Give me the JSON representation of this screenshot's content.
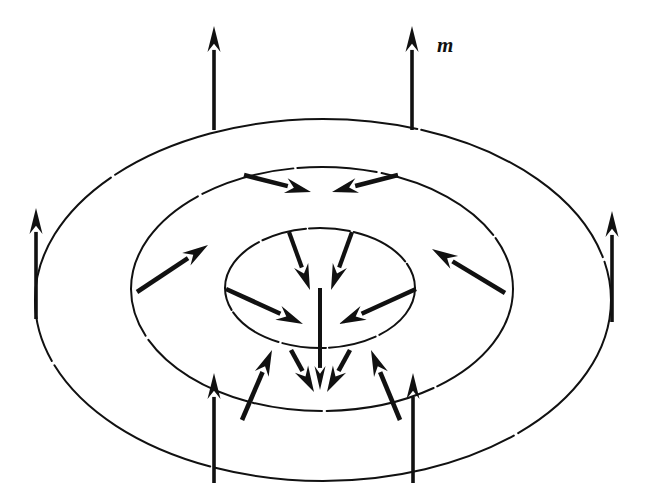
{
  "figure": {
    "domain_type": "diagram",
    "background_color": "#ffffff",
    "ink_color": "#111111",
    "width": 646,
    "height": 503,
    "labels": [
      {
        "id": "magnetization-label",
        "text": "m",
        "x": 437,
        "y": 52,
        "style": "bold-italic-serif",
        "font_size": 21
      }
    ],
    "rings": [
      {
        "id": "outer-ring",
        "name": "outer-ellipse",
        "cx": 323,
        "cy": 300,
        "rx": 288,
        "ry": 181,
        "stroke_width": 2.0,
        "dash": "hand-drawn"
      },
      {
        "id": "middle-ring",
        "name": "middle-ellipse",
        "cx": 322,
        "cy": 289,
        "rx": 191,
        "ry": 122,
        "stroke_width": 2.0,
        "dash": "hand-drawn"
      },
      {
        "id": "inner-ring",
        "name": "inner-ellipse",
        "cx": 320,
        "cy": 288,
        "rx": 95,
        "ry": 60,
        "stroke_width": 2.0,
        "dash": "hand-drawn"
      }
    ],
    "vectors": [
      {
        "id": "v-outer-top-left",
        "group": "outer-ring",
        "direction": "up",
        "x1": 214,
        "y1": 130,
        "x2": 214,
        "y2": 26,
        "stroke_width": 3.6,
        "head_len": 26,
        "head_w": 13
      },
      {
        "id": "v-outer-top-right",
        "group": "outer-ring",
        "direction": "up",
        "x1": 412,
        "y1": 130,
        "x2": 412,
        "y2": 26,
        "stroke_width": 3.6,
        "head_len": 26,
        "head_w": 13
      },
      {
        "id": "v-outer-left",
        "group": "outer-ring",
        "direction": "up",
        "x1": 36,
        "y1": 319,
        "x2": 36,
        "y2": 208,
        "stroke_width": 3.6,
        "head_len": 26,
        "head_w": 13
      },
      {
        "id": "v-outer-right",
        "group": "outer-ring",
        "direction": "up",
        "x1": 612,
        "y1": 322,
        "x2": 612,
        "y2": 211,
        "stroke_width": 3.6,
        "head_len": 26,
        "head_w": 13
      },
      {
        "id": "v-outer-bottom-left",
        "group": "outer-ring",
        "direction": "up",
        "x1": 214,
        "y1": 483,
        "x2": 214,
        "y2": 373,
        "stroke_width": 3.6,
        "head_len": 26,
        "head_w": 13
      },
      {
        "id": "v-outer-bottom-right",
        "group": "outer-ring",
        "direction": "up",
        "x1": 413,
        "y1": 483,
        "x2": 413,
        "y2": 373,
        "stroke_width": 3.6,
        "head_len": 26,
        "head_w": 13
      },
      {
        "id": "v-mid-top-left",
        "group": "middle-ring",
        "direction": "down-right",
        "x1": 244,
        "y1": 175,
        "x2": 311,
        "y2": 192,
        "stroke_width": 4.6,
        "head_len": 26,
        "head_w": 15
      },
      {
        "id": "v-mid-top-right",
        "group": "middle-ring",
        "direction": "down-left",
        "x1": 398,
        "y1": 175,
        "x2": 332,
        "y2": 192,
        "stroke_width": 4.6,
        "head_len": 26,
        "head_w": 15
      },
      {
        "id": "v-mid-left",
        "group": "middle-ring",
        "direction": "up-right",
        "x1": 137,
        "y1": 292,
        "x2": 208,
        "y2": 245,
        "stroke_width": 4.6,
        "head_len": 26,
        "head_w": 15
      },
      {
        "id": "v-mid-right",
        "group": "middle-ring",
        "direction": "up-left",
        "x1": 505,
        "y1": 293,
        "x2": 432,
        "y2": 249,
        "stroke_width": 4.6,
        "head_len": 26,
        "head_w": 15
      },
      {
        "id": "v-mid-bottom-left",
        "group": "middle-ring",
        "direction": "up-right",
        "x1": 242,
        "y1": 420,
        "x2": 272,
        "y2": 350,
        "stroke_width": 4.6,
        "head_len": 26,
        "head_w": 15
      },
      {
        "id": "v-mid-bottom-right",
        "group": "middle-ring",
        "direction": "up-left",
        "x1": 400,
        "y1": 420,
        "x2": 371,
        "y2": 350,
        "stroke_width": 4.6,
        "head_len": 26,
        "head_w": 15
      },
      {
        "id": "v-inner-top-left",
        "group": "inner-ring",
        "direction": "down-right",
        "x1": 289,
        "y1": 232,
        "x2": 310,
        "y2": 290,
        "stroke_width": 4.2,
        "head_len": 26,
        "head_w": 15
      },
      {
        "id": "v-inner-top-right",
        "group": "inner-ring",
        "direction": "down-left",
        "x1": 352,
        "y1": 232,
        "x2": 331,
        "y2": 290,
        "stroke_width": 4.2,
        "head_len": 26,
        "head_w": 15
      },
      {
        "id": "v-inner-left",
        "group": "inner-ring",
        "direction": "down-right",
        "x1": 226,
        "y1": 289,
        "x2": 303,
        "y2": 324,
        "stroke_width": 4.6,
        "head_len": 27,
        "head_w": 15
      },
      {
        "id": "v-inner-right",
        "group": "inner-ring",
        "direction": "down-left",
        "x1": 416,
        "y1": 289,
        "x2": 339,
        "y2": 324,
        "stroke_width": 4.6,
        "head_len": 27,
        "head_w": 15
      },
      {
        "id": "v-center-vertical",
        "group": "inner-ring",
        "direction": "down",
        "x1": 320,
        "y1": 288,
        "x2": 320,
        "y2": 390,
        "stroke_width": 4.0,
        "head_len": 24,
        "head_w": 11
      },
      {
        "id": "v-bottom-left-converge",
        "group": "inner-ring",
        "direction": "down-right",
        "x1": 291,
        "y1": 350,
        "x2": 314,
        "y2": 392,
        "stroke_width": 4.6,
        "head_len": 26,
        "head_w": 15
      },
      {
        "id": "v-bottom-right-converge",
        "group": "inner-ring",
        "direction": "down-left",
        "x1": 350,
        "y1": 350,
        "x2": 327,
        "y2": 392,
        "stroke_width": 4.6,
        "head_len": 26,
        "head_w": 15
      }
    ],
    "description": {
      "summary": "Three concentric ellipses representing circular domain walls of a magnetic bubble, with magnetization vectors m rotating from up at the outer ring, through in-plane inward at the middle ring, to down at the center.",
      "outer_ring_state": "magnetization points up (out of plane)",
      "middle_ring_state": "magnetization tilts inward toward the center",
      "inner_ring_state": "magnetization points down (into plane) at the core"
    }
  }
}
